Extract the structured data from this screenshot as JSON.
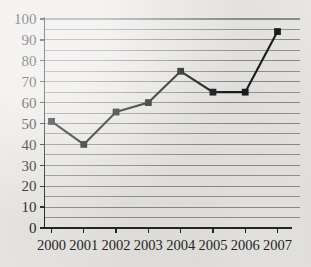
{
  "chart_data": {
    "type": "line",
    "title": "",
    "subtitle": "",
    "xlabel": "",
    "ylabel": "",
    "categories": [
      "2000",
      "2001",
      "2002",
      "2003",
      "2004",
      "2005",
      "2006",
      "2007"
    ],
    "x": [
      2000,
      2001,
      2002,
      2003,
      2004,
      2005,
      2006,
      2007
    ],
    "values": [
      51,
      40,
      55.5,
      60,
      75,
      65,
      65,
      94
    ],
    "series": [
      {
        "name": "series-1",
        "values": [
          51,
          40,
          55.5,
          60,
          75,
          65,
          65,
          94
        ],
        "marker": "square",
        "marker_color": "#1c1c20",
        "line_color": "#1c1c20"
      }
    ],
    "ylim": [
      0,
      100
    ],
    "y_major_ticks": [
      0,
      10,
      20,
      30,
      40,
      50,
      60,
      70,
      80,
      90,
      100
    ],
    "y_major_tick_labels": [
      "0",
      "10",
      "20",
      "30",
      "40",
      "50",
      "60",
      "70",
      "80",
      "90",
      "100"
    ],
    "y_minor_step": 5,
    "x_tick_labels": [
      "2000",
      "2001",
      "2002",
      "2003",
      "2004",
      "2005",
      "2006",
      "2007"
    ],
    "grid": {
      "horizontal": true,
      "vertical": false,
      "minor_horizontal": true,
      "color": "#8a8a8e"
    },
    "legend": {
      "visible": false,
      "position": "none",
      "entries": []
    },
    "axes": {
      "left_spine": true,
      "bottom_spine": true,
      "top_spine": false,
      "right_spine": false,
      "tick_direction": "out"
    },
    "colors": {
      "background": "#eceae6",
      "ink": "#26262a",
      "grid": "#8a8a8e",
      "series": "#1c1c20"
    }
  }
}
